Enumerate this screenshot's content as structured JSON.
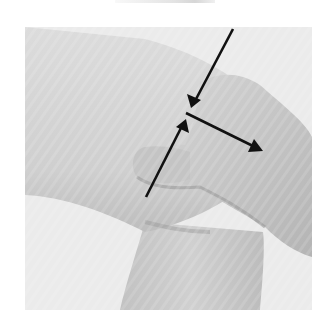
{
  "figure": {
    "caption_cropped": "",
    "arrows": [
      {
        "name": "arrow-down-left",
        "direction": "down-left"
      },
      {
        "name": "arrow-up-right",
        "direction": "up-right"
      },
      {
        "name": "arrow-right-down",
        "direction": "down-right"
      }
    ],
    "colors": {
      "background": "#ebebeb",
      "skin_light": "#dadada",
      "skin_mid": "#c8c8c8",
      "skin_shadow": "#a8a8a8",
      "arrow": "#111111"
    }
  }
}
